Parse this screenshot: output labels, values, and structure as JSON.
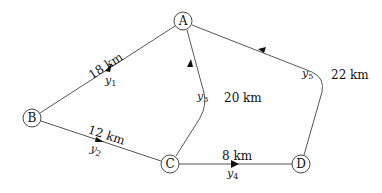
{
  "nodes": {
    "A": {
      "label": "A"
    },
    "B": {
      "label": "B"
    },
    "C": {
      "label": "C"
    },
    "D": {
      "label": "D"
    }
  },
  "edges": {
    "y1": {
      "from": "B",
      "to": "A",
      "distance": "18 km",
      "var": "y",
      "sub": "1"
    },
    "y2": {
      "from": "B",
      "to": "C",
      "distance": "12 km",
      "var": "y",
      "sub": "2"
    },
    "y3": {
      "from": "C",
      "to": "A",
      "distance": "20 km",
      "var": "y",
      "sub": "3"
    },
    "y4": {
      "from": "C",
      "to": "D",
      "distance": "8 km",
      "var": "y",
      "sub": "4"
    },
    "y5": {
      "from": "D",
      "to": "A",
      "distance": "22 km",
      "var": "y",
      "sub": "5"
    }
  }
}
